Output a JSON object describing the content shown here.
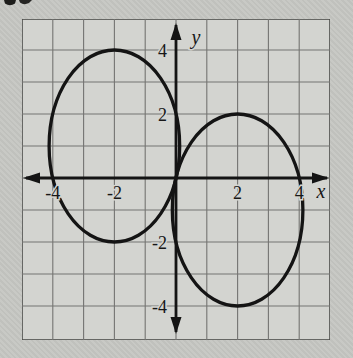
{
  "colors": {
    "page_background": "#c6c7c3",
    "plot_background": "#d3d4d0",
    "grid_line": "#747472",
    "plot_border": "#4b4b49",
    "axis_ink": "#141414",
    "curve_ink": "#141414",
    "label_ink": "#171717"
  },
  "chart_data": {
    "type": "line",
    "title": "",
    "subtitle": "",
    "xlabel": "x",
    "ylabel": "y",
    "xlim": [
      -5,
      5
    ],
    "ylim": [
      -5,
      5
    ],
    "grid": true,
    "grid_step": 1,
    "axis_arrows": "both-ends",
    "x_ticks": [
      {
        "value": -4,
        "label": "-4"
      },
      {
        "value": -2,
        "label": "-2"
      },
      {
        "value": 2,
        "label": "2"
      },
      {
        "value": 4,
        "label": "4"
      }
    ],
    "y_ticks": [
      {
        "value": 4,
        "label": "4"
      },
      {
        "value": 2,
        "label": "2"
      },
      {
        "value": -2,
        "label": "-2"
      },
      {
        "value": -4,
        "label": "-4"
      }
    ],
    "series": [
      {
        "name": "left-ellipse",
        "shape": "ellipse",
        "center": [
          -2,
          1
        ],
        "rx": 2.12,
        "ry": 3,
        "points_on_curve": [
          [
            -4,
            0
          ],
          [
            0,
            0
          ],
          [
            0,
            2
          ],
          [
            -2,
            4
          ],
          [
            -2,
            -2
          ]
        ]
      },
      {
        "name": "right-ellipse",
        "shape": "ellipse",
        "center": [
          2,
          -1
        ],
        "rx": 2.12,
        "ry": 3,
        "points_on_curve": [
          [
            0,
            0
          ],
          [
            4,
            0
          ],
          [
            0,
            -2
          ],
          [
            2,
            2
          ],
          [
            2,
            -4
          ]
        ]
      }
    ]
  }
}
